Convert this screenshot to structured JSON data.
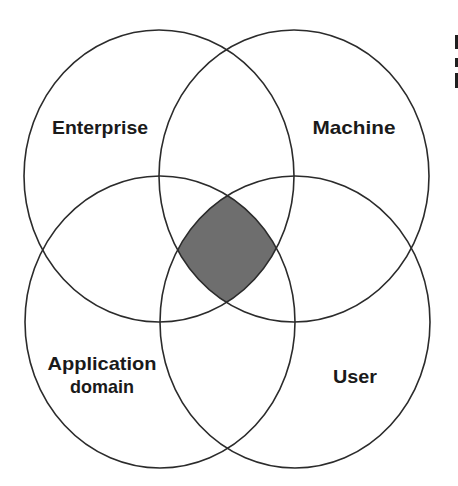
{
  "diagram": {
    "type": "venn",
    "title": "",
    "sets": [
      {
        "id": "enterprise",
        "label": "Enterprise",
        "position": "top-left"
      },
      {
        "id": "machine",
        "label": "Machine",
        "position": "top-right"
      },
      {
        "id": "application-domain",
        "label_lines": [
          "Application",
          "domain"
        ],
        "position": "bottom-left"
      },
      {
        "id": "user",
        "label": "User",
        "position": "bottom-right"
      }
    ],
    "highlighted_region": {
      "description": "intersection of all four sets",
      "members": [
        "Enterprise",
        "Machine",
        "Application domain",
        "User"
      ],
      "fill_color": "#6e6e6e"
    },
    "colors": {
      "stroke": "#2b2b2b",
      "background": "#ffffff",
      "text": "#1a1a1a"
    }
  }
}
